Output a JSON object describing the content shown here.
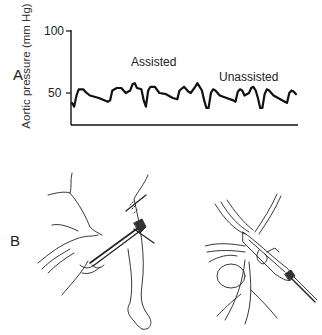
{
  "figure": {
    "panel_a_label": "A",
    "panel_b_label": "B"
  },
  "chart_data": {
    "type": "line",
    "title": "",
    "xlabel": "",
    "ylabel": "Aortic pressure (mm Hg)",
    "yticks": [
      50,
      100
    ],
    "ylim": [
      25,
      100
    ],
    "grid": false,
    "legend": null,
    "annotations": [
      {
        "text": "Assisted",
        "x_frac": 0.36,
        "y": 70
      },
      {
        "text": "Unassisted",
        "x_frac": 0.73,
        "y": 66
      }
    ],
    "series": [
      {
        "name": "Aortic pressure",
        "points": [
          [
            0.0,
            42
          ],
          [
            0.01,
            39
          ],
          [
            0.02,
            48
          ],
          [
            0.03,
            53
          ],
          [
            0.05,
            53
          ],
          [
            0.06,
            51
          ],
          [
            0.08,
            48
          ],
          [
            0.12,
            46
          ],
          [
            0.16,
            43
          ],
          [
            0.17,
            44
          ],
          [
            0.18,
            52
          ],
          [
            0.2,
            54
          ],
          [
            0.22,
            54
          ],
          [
            0.24,
            50
          ],
          [
            0.26,
            52
          ],
          [
            0.27,
            57
          ],
          [
            0.28,
            58
          ],
          [
            0.29,
            54
          ],
          [
            0.31,
            53
          ],
          [
            0.32,
            44
          ],
          [
            0.33,
            39
          ],
          [
            0.34,
            52
          ],
          [
            0.35,
            55
          ],
          [
            0.37,
            55
          ],
          [
            0.39,
            50
          ],
          [
            0.42,
            49
          ],
          [
            0.45,
            46
          ],
          [
            0.47,
            45
          ],
          [
            0.48,
            52
          ],
          [
            0.5,
            55
          ],
          [
            0.52,
            51
          ],
          [
            0.53,
            50
          ],
          [
            0.55,
            55
          ],
          [
            0.56,
            58
          ],
          [
            0.58,
            52
          ],
          [
            0.59,
            44
          ],
          [
            0.6,
            38
          ],
          [
            0.61,
            38
          ],
          [
            0.62,
            50
          ],
          [
            0.63,
            53
          ],
          [
            0.64,
            52
          ],
          [
            0.66,
            48
          ],
          [
            0.69,
            46
          ],
          [
            0.72,
            44
          ],
          [
            0.73,
            43
          ],
          [
            0.74,
            51
          ],
          [
            0.75,
            53
          ],
          [
            0.76,
            52
          ],
          [
            0.77,
            48
          ],
          [
            0.79,
            50
          ],
          [
            0.8,
            54
          ],
          [
            0.81,
            55
          ],
          [
            0.82,
            52
          ],
          [
            0.83,
            46
          ],
          [
            0.84,
            38
          ],
          [
            0.85,
            38
          ],
          [
            0.86,
            49
          ],
          [
            0.87,
            53
          ],
          [
            0.88,
            52
          ],
          [
            0.9,
            48
          ],
          [
            0.93,
            45
          ],
          [
            0.95,
            43
          ],
          [
            0.96,
            42
          ],
          [
            0.97,
            50
          ],
          [
            0.98,
            52
          ],
          [
            0.99,
            51
          ],
          [
            1.0,
            49
          ]
        ]
      }
    ]
  },
  "illustrations": [
    {
      "name": "infant-groin-cannulation-drawing",
      "panel": "B",
      "position": "left"
    },
    {
      "name": "vessel-cannulation-detail-drawing",
      "panel": "B",
      "position": "right"
    }
  ]
}
